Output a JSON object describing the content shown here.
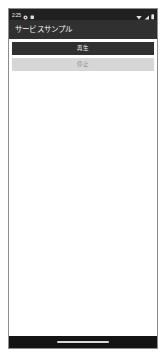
{
  "device": {
    "platform": "android",
    "frame_border_color": "#8d8d8d",
    "page_background": "#ffffff"
  },
  "status_bar": {
    "background_color": "#212121",
    "foreground_color": "#ededed",
    "clock": "2:25",
    "left_icons": [
      {
        "name": "gear-icon",
        "label": "settings"
      },
      {
        "name": "app-notification-icon",
        "label": "app"
      }
    ],
    "right_icons": [
      {
        "name": "wifi-icon",
        "label": "wifi"
      },
      {
        "name": "signal-icon",
        "label": "signal"
      },
      {
        "name": "battery-icon",
        "label": "battery"
      }
    ]
  },
  "app_bar": {
    "background_color": "#303030",
    "title": "サービスサンプル"
  },
  "main": {
    "background_color": "#ffffff",
    "buttons": [
      {
        "name": "play-button",
        "label": "再生",
        "style": "filled-dark",
        "background_color": "#303030",
        "text_color": "#f0f0f0",
        "enabled": true
      },
      {
        "name": "stop-button",
        "label": "停止",
        "style": "filled-light",
        "background_color": "#d6d6d6",
        "text_color": "#8a8a8a",
        "enabled": false
      }
    ]
  },
  "nav_bar": {
    "background_color": "#141414",
    "gesture_pill_color": "#d8d8d8"
  }
}
